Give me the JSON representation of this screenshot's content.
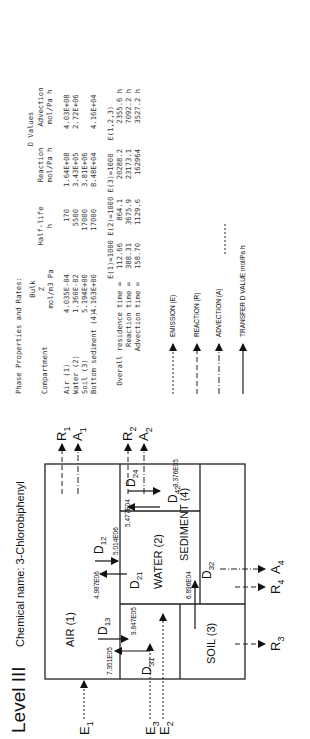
{
  "header": {
    "level": "Level III",
    "chemical_label": "Chemical name:",
    "chemical_name": "3-Chlorobiphenyl"
  },
  "compartments": {
    "air": "AIR (1)",
    "water": "WATER (2)",
    "soil": "SOIL (3)",
    "sediment": "SEDIMENT (4)"
  },
  "flows": {
    "emissions": [
      "E",
      "E",
      "E"
    ],
    "emission_subs": [
      "1",
      "2",
      "3"
    ],
    "D12": {
      "label": "D",
      "sub": "12",
      "value": "5.014E06"
    },
    "D21": {
      "label": "D",
      "sub": "21",
      "value": "4.987E06"
    },
    "D13": {
      "label": "D",
      "sub": "13",
      "value": "9.847E05"
    },
    "D31": {
      "label": "D",
      "sub": "31",
      "value": "7.351E05"
    },
    "D32": {
      "label": "D",
      "sub": "32",
      "value": "6.896E04"
    },
    "D24": {
      "label": "D",
      "sub": "24",
      "value": "5.477E04"
    },
    "D42": {
      "label": "D",
      "sub": "42",
      "value": "3.376E05"
    },
    "outputs": {
      "R1": {
        "label": "R",
        "sub": "1"
      },
      "A1": {
        "label": "A",
        "sub": "1"
      },
      "R2": {
        "label": "R",
        "sub": "2"
      },
      "A2": {
        "label": "A",
        "sub": "2"
      },
      "R3": {
        "label": "R",
        "sub": "3"
      },
      "R4": {
        "label": "R",
        "sub": "4"
      },
      "A4": {
        "label": "A",
        "sub": "4"
      }
    }
  },
  "phase_table": {
    "title": "Phase Properties and Rates:",
    "headers": {
      "compartment": "Compartment",
      "bulk_z": [
        "Bulk",
        "Z",
        "mol/m3 Pa"
      ],
      "half_life": [
        "Half-life",
        "h"
      ],
      "d_values": "D Values",
      "reaction": [
        "Reaction",
        "mol/Pa h"
      ],
      "advection": [
        "Advection",
        "mol/Pa h"
      ]
    },
    "rows": [
      {
        "name": "Air (1)",
        "z": "4.035E-04",
        "half_life": "170",
        "reaction": "1.64E+08",
        "advection": "4.03E+08"
      },
      {
        "name": "Water (2)",
        "z": "1.360E-02",
        "half_life": "5500",
        "reaction": "3.43E+05",
        "advection": "2.72E+06"
      },
      {
        "name": "Soil (3)",
        "z": "5.194E+00",
        "half_life": "17000",
        "reaction": "3.81E+06",
        "advection": ""
      },
      {
        "name": "Bottom sediment (4)",
        "z": "4.163E+00",
        "half_life": "17000",
        "reaction": "8.48E+04",
        "advection": "4.16E+04"
      }
    ]
  },
  "residence": {
    "headers": [
      "E(1)=1000",
      "E(2)=1000",
      "E(3)=1000",
      "E(1,2,3)"
    ],
    "rows": [
      {
        "label": "Overall residence time =",
        "values": [
          "112.66",
          "864.1",
          "20288.2",
          "2355.6 h"
        ]
      },
      {
        "label": "Reaction time =",
        "values": [
          "388.31",
          "3675.9",
          "23173.1",
          "7092.2 h"
        ]
      },
      {
        "label": "Advection time =",
        "values": [
          "158.70",
          "1129.6",
          "162964",
          "3527.2 h"
        ]
      }
    ]
  },
  "legend": [
    {
      "style": "dotted",
      "label": "EMISSION (E)"
    },
    {
      "style": "dashed",
      "label": "REACTION (R)"
    },
    {
      "style": "dashdot",
      "label": "ADVECTION (A)"
    },
    {
      "style": "solid",
      "label": "TRANSFER D VALUE mol/Pa h"
    }
  ]
}
